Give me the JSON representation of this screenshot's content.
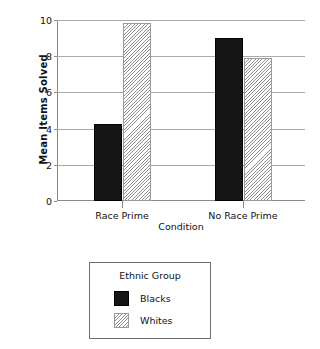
{
  "chart_data": {
    "type": "bar",
    "title": "",
    "xlabel": "Condition",
    "ylabel": "Mean Items Solved",
    "categories": [
      "Race Prime",
      "No Race Prime"
    ],
    "series": [
      {
        "name": "Blacks",
        "values": [
          4.25,
          9.0
        ],
        "fill": "solid",
        "color": "#151515"
      },
      {
        "name": "Whites",
        "values": [
          9.85,
          7.9
        ],
        "fill": "hatch",
        "color": "#ffffff"
      }
    ],
    "ylim": [
      0,
      10
    ],
    "yticks": [
      0,
      2,
      4,
      6,
      8,
      10
    ],
    "ytick_labels": [
      "0",
      "2",
      "4",
      "6",
      "8",
      "10"
    ],
    "grid": true,
    "legend": {
      "title": "Ethnic Group",
      "position": "below-plot",
      "entries": [
        "Blacks",
        "Whites"
      ]
    }
  },
  "axes": {
    "y_title": "Mean Items Solved",
    "x_title": "Condition"
  }
}
